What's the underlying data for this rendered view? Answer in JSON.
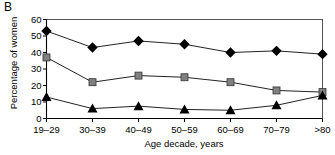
{
  "panel": {
    "label": "B"
  },
  "chart_data": {
    "type": "line",
    "title": "",
    "subtitle": "",
    "panel_label": "B",
    "xlabel": "Age decade, years",
    "ylabel": "Percentage of women",
    "categories": [
      "19–29",
      "30–39",
      "40–49",
      "50–59",
      "60–69",
      "70–79",
      ">80"
    ],
    "yticks": [
      0,
      10,
      20,
      30,
      40,
      50,
      60
    ],
    "ylim": [
      0,
      60
    ],
    "grid": false,
    "legend": "none",
    "series": [
      {
        "name": "diamond-series",
        "marker": "diamond",
        "color": "#000000",
        "values": [
          53,
          43,
          47,
          45,
          40,
          41,
          39
        ]
      },
      {
        "name": "square-series",
        "marker": "square",
        "color": "#808080",
        "values": [
          37,
          22,
          26,
          25,
          22,
          17,
          16
        ]
      },
      {
        "name": "triangle-series",
        "marker": "triangle",
        "color": "#000000",
        "values": [
          13,
          6,
          7.5,
          5.5,
          5,
          8,
          14
        ]
      }
    ]
  }
}
